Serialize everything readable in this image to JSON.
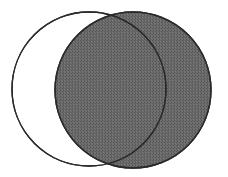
{
  "figure": {
    "title": "Two overlapping circles Venn diagram",
    "canvas": {
      "width": 228,
      "height": 177,
      "background_color": "#ffffff"
    },
    "colors": {
      "background": "#ffffff",
      "stroke": "#2a2a2a",
      "left_circle_fill": "#ffffff",
      "right_circle_fill": "#6a6a6a",
      "texture_dark": "#4f4f4f",
      "texture_light": "#7d7d7d"
    },
    "stroke_width": 1.4
  },
  "chart_data": {
    "type": "venn",
    "title": "Two overlapping circles Venn diagram",
    "xlabel": "",
    "ylabel": "",
    "grid": false,
    "legend": false,
    "sets": [
      {
        "name": "left-circle",
        "label": "",
        "cx": 89,
        "cy": 89,
        "r": 77,
        "fill": "#ffffff",
        "filled": false,
        "stroke": "#2a2a2a",
        "bounds": {
          "left": 12,
          "right": 166,
          "top": 12,
          "bottom": 166
        }
      },
      {
        "name": "right-circle",
        "label": "",
        "cx": 133,
        "cy": 90,
        "r": 78,
        "fill": "#6a6a6a",
        "filled": true,
        "stroke": "#2a2a2a",
        "bounds": {
          "left": 55,
          "right": 211,
          "top": 12,
          "bottom": 168
        }
      }
    ],
    "intersection_points": [
      {
        "name": "top",
        "x": 112,
        "y": 12
      },
      {
        "name": "bottom",
        "x": 115,
        "y": 166
      }
    ],
    "regions": [
      {
        "name": "left-only",
        "fill": "#ffffff",
        "shaded": false
      },
      {
        "name": "intersection",
        "fill": "#6a6a6a",
        "shaded": true
      },
      {
        "name": "right-only",
        "fill": "#6a6a6a",
        "shaded": true
      }
    ],
    "annotations": []
  }
}
